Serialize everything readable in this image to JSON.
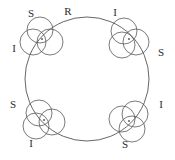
{
  "figure": {
    "background_color": "#ffffff",
    "stroke_color": "#4a4a4a",
    "label_color": "#2b2b2b",
    "width": 175,
    "height": 160
  },
  "chart_data": {
    "type": "diagram",
    "title": "",
    "main_circle": {
      "cx": 87,
      "cy": 79,
      "r": 62
    },
    "node_circle_radius": 13,
    "nodes": [
      {
        "id": "node-top-left",
        "position_deg": 135,
        "cx": 45,
        "cy": 36,
        "circles": [
          {
            "cx": 40,
            "cy": 30,
            "r": 13
          },
          {
            "cx": 33,
            "cy": 42,
            "r": 13
          },
          {
            "cx": 50,
            "cy": 42,
            "r": 13
          }
        ],
        "center_dot": {
          "cx": 42,
          "cy": 39,
          "r": 1.1
        },
        "labels": [
          {
            "text": "S",
            "x": 31,
            "y": 14
          },
          {
            "text": "I",
            "x": 14,
            "y": 49
          }
        ]
      },
      {
        "id": "node-top-right",
        "position_deg": 45,
        "cx": 129,
        "cy": 36,
        "circles": [
          {
            "cx": 124,
            "cy": 31,
            "r": 13
          },
          {
            "cx": 136,
            "cy": 42,
            "r": 13
          },
          {
            "cx": 122,
            "cy": 45,
            "r": 13
          }
        ],
        "center_dot": {
          "cx": 129,
          "cy": 39,
          "r": 1.1
        },
        "labels": [
          {
            "text": "I",
            "x": 115,
            "y": 13
          },
          {
            "text": "S",
            "x": 161,
            "y": 53
          }
        ]
      },
      {
        "id": "node-bottom-left",
        "position_deg": 225,
        "cx": 45,
        "cy": 122,
        "circles": [
          {
            "cx": 39,
            "cy": 113,
            "r": 13
          },
          {
            "cx": 36,
            "cy": 126,
            "r": 13
          },
          {
            "cx": 52,
            "cy": 122,
            "r": 13
          }
        ],
        "center_dot": {
          "cx": 44,
          "cy": 120,
          "r": 1.1
        },
        "labels": [
          {
            "text": "S",
            "x": 13,
            "y": 105
          },
          {
            "text": "I",
            "x": 31,
            "y": 144
          }
        ]
      },
      {
        "id": "node-bottom-right",
        "position_deg": 315,
        "cx": 129,
        "cy": 122,
        "circles": [
          {
            "cx": 135,
            "cy": 114,
            "r": 13
          },
          {
            "cx": 122,
            "cy": 119,
            "r": 13
          },
          {
            "cx": 132,
            "cy": 129,
            "r": 13
          }
        ],
        "center_dot": {
          "cx": 129,
          "cy": 121,
          "r": 1.1
        },
        "labels": [
          {
            "text": "I",
            "x": 161,
            "y": 105
          },
          {
            "text": "S",
            "x": 125,
            "y": 145
          }
        ]
      }
    ],
    "arc_labels": [
      {
        "text": "R",
        "x": 68,
        "y": 12
      }
    ]
  }
}
